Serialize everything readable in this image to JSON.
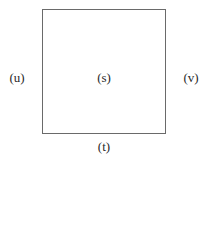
{
  "diagram": {
    "type": "labeled-square",
    "labels": {
      "center": "(s)",
      "bottom": "(t)",
      "left": "(u)",
      "right": "(v)"
    },
    "colors": {
      "border": "#6a6a6a",
      "text": "#2a2a2a",
      "background": "#ffffff"
    }
  }
}
